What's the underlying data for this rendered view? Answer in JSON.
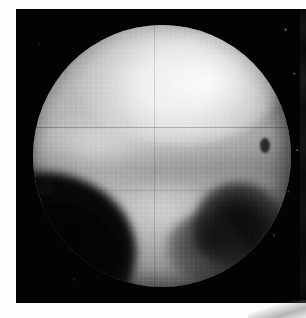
{
  "page": {
    "background_color": "#fdfdfd",
    "width": 306,
    "height": 318
  },
  "figure": {
    "name": "pluto-surface-map",
    "alt_text": "Grayscale telescopic image of the disk of Pluto showing a bright north polar cap, mottled mid-latitude terrain, a dark region on the lower-left limb and a prominent dark spot near the lower-right limb",
    "plate": {
      "background_color": "#030303",
      "left": 16,
      "top": 9,
      "width": 290,
      "height": 294
    },
    "disk": {
      "center_x": 146,
      "center_y": 147,
      "radius": 129,
      "base_color": "#b0b0b0",
      "limb_color": "#3a3a3a"
    },
    "features": [
      {
        "label": "north-polar-cap",
        "brightness": "bright",
        "color": "#ffffff"
      },
      {
        "label": "northeast-bright-lobe",
        "brightness": "bright",
        "color": "#f0f0f0"
      },
      {
        "label": "western-bright-band",
        "brightness": "bright",
        "color": "#e8e8e8"
      },
      {
        "label": "southern-bright-streak",
        "brightness": "bright",
        "color": "#e4e4e4"
      },
      {
        "label": "dusky-equatorial-belt",
        "brightness": "mid",
        "color": "#8a8a8a"
      },
      {
        "label": "southwest-dark-terrain",
        "brightness": "very-dark",
        "color": "#050505"
      },
      {
        "label": "southeast-dark-spot",
        "brightness": "very-dark",
        "color": "#0a0a0a"
      },
      {
        "label": "eastern-limb-fleck",
        "brightness": "dark",
        "color": "#191919"
      },
      {
        "label": "western-limb-nick",
        "brightness": "dark",
        "color": "#141414"
      }
    ],
    "adjacent_frame_sliver": {
      "label": "right-edge-sliver",
      "color": "#0d0d0d",
      "width": 6
    }
  }
}
